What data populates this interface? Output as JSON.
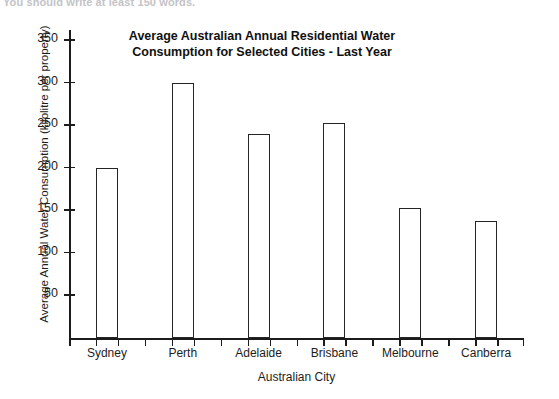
{
  "scan": {
    "top_cutoff_text": "You should write at least 150 words."
  },
  "chart_data": {
    "type": "bar",
    "title": "Average Australian Annual Residential Water Consumption for Selected Cities - Last Year",
    "title_lines": [
      "Average Australian Annual Residential Water",
      "Consumption for Selected Cities - Last Year"
    ],
    "xlabel": "Australian City",
    "ylabel": "Average Annual Water Consumption (kilolitre per property)",
    "categories": [
      "Sydney",
      "Perth",
      "Adelaide",
      "Brisbane",
      "Melbourne",
      "Canberra"
    ],
    "values": [
      200,
      300,
      240,
      253,
      153,
      138
    ],
    "unit": "kilolitre per property",
    "ylim": [
      0,
      365
    ],
    "yticks": [
      50,
      100,
      150,
      200,
      250,
      300,
      350
    ],
    "ytick_labels": [
      "50",
      "100",
      "150",
      "200",
      "250",
      "300",
      "350"
    ],
    "grid": false,
    "legend": false,
    "bar_fill": "#ffffff",
    "bar_edge": "#252525",
    "axis_color": "#1c1c1c"
  }
}
